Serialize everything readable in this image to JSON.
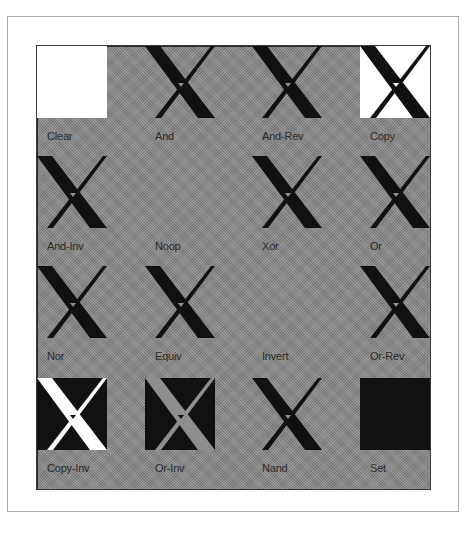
{
  "colors": {
    "background_gray": "#8e8e8e",
    "white": "#ffffff",
    "black": "#111111",
    "label": "#2b2b2b"
  },
  "cells": [
    {
      "label": "Clear",
      "mode": "clear"
    },
    {
      "label": "And",
      "mode": "and"
    },
    {
      "label": "And-Rev",
      "mode": "and-rev"
    },
    {
      "label": "Copy",
      "mode": "copy"
    },
    {
      "label": "And-Inv",
      "mode": "and-inv"
    },
    {
      "label": "Noop",
      "mode": "noop"
    },
    {
      "label": "Xor",
      "mode": "xor"
    },
    {
      "label": "Or",
      "mode": "or"
    },
    {
      "label": "Nor",
      "mode": "nor"
    },
    {
      "label": "Equiv",
      "mode": "equiv"
    },
    {
      "label": "Invert",
      "mode": "invert"
    },
    {
      "label": "Or-Rev",
      "mode": "or-rev"
    },
    {
      "label": "Copy-Inv",
      "mode": "copy-inv"
    },
    {
      "label": "Or-Inv",
      "mode": "or-inv"
    },
    {
      "label": "Nand",
      "mode": "nand"
    },
    {
      "label": "Set",
      "mode": "set"
    }
  ]
}
